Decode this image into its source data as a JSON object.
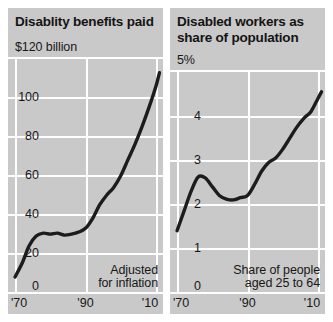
{
  "figure": {
    "background_color": "#ffffff",
    "panel_color": "#c9c9c9",
    "gridline_color": "#ffffff",
    "line_color": "#1c1c1c"
  },
  "panels": [
    {
      "title": "Disablity benefits paid",
      "axis_top_label": "$120 billion",
      "yticks": [
        "100",
        "80",
        "60",
        "40",
        "20",
        "0"
      ],
      "xticks": [
        "'70",
        "'90",
        "'10"
      ],
      "annotation_line1": "Adjusted",
      "annotation_line2": "for inflation"
    },
    {
      "title_line1": "Disabled workers as",
      "title_line2": "share of population",
      "axis_top_label": "5%",
      "yticks": [
        "4",
        "3",
        "2",
        "1",
        "0"
      ],
      "xticks": [
        "'70",
        "'90",
        "'10"
      ],
      "annotation_line1": "Share of people",
      "annotation_line2": "aged 25 to 64"
    }
  ],
  "chart_data": [
    {
      "type": "line",
      "title": "Disablity benefits paid",
      "xlabel": "",
      "ylabel": "$120 billion",
      "annotation": "Adjusted for inflation",
      "xlim": [
        1968,
        2012
      ],
      "ylim": [
        0,
        120
      ],
      "ytick_values": [
        0,
        20,
        40,
        60,
        80,
        100
      ],
      "xtick_values": [
        1970,
        1990,
        2010
      ],
      "xtick_labels": [
        "'70",
        "'90",
        "'10"
      ],
      "grid": true,
      "legend": "none",
      "x": [
        1970,
        1972,
        1974,
        1976,
        1978,
        1980,
        1982,
        1984,
        1986,
        1988,
        1990,
        1992,
        1994,
        1996,
        1998,
        2000,
        2002,
        2004,
        2006,
        2008,
        2010,
        2011
      ],
      "values": [
        8,
        15,
        24,
        29,
        30.5,
        30,
        30.5,
        29.5,
        30,
        31,
        33,
        38,
        45,
        50,
        54,
        60,
        68,
        76,
        85,
        95,
        106,
        113
      ]
    },
    {
      "type": "line",
      "title": "Disabled workers as share of population",
      "xlabel": "",
      "ylabel": "5%",
      "annotation": "Share of people aged 25 to 64",
      "xlim": [
        1968,
        2012
      ],
      "ylim": [
        0,
        5
      ],
      "ytick_values": [
        0,
        1,
        2,
        3,
        4
      ],
      "xtick_values": [
        1970,
        1990,
        2010
      ],
      "xtick_labels": [
        "'70",
        "'90",
        "'10"
      ],
      "grid": true,
      "legend": "none",
      "x": [
        1970,
        1972,
        1974,
        1976,
        1978,
        1980,
        1982,
        1984,
        1986,
        1988,
        1990,
        1992,
        1994,
        1996,
        1998,
        2000,
        2002,
        2004,
        2006,
        2008,
        2010,
        2011
      ],
      "values": [
        1.4,
        1.85,
        2.3,
        2.62,
        2.6,
        2.4,
        2.2,
        2.12,
        2.1,
        2.15,
        2.2,
        2.45,
        2.75,
        2.95,
        3.05,
        3.25,
        3.5,
        3.75,
        3.95,
        4.1,
        4.4,
        4.55
      ]
    }
  ]
}
